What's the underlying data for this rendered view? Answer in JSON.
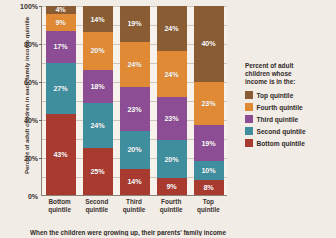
{
  "chart_data": {
    "type": "bar",
    "subtype": "stacked-percent-column",
    "title": "",
    "xlabel": "When the children were growing up, their parents' family income",
    "ylabel": "Percent of adult children in each family income quintile",
    "categories": [
      "Bottom quintile",
      "Second quintile",
      "Third quintile",
      "Fourth quintile",
      "Top quintile"
    ],
    "ylim": [
      0,
      100
    ],
    "yticks": [
      "0%",
      "20%",
      "40%",
      "60%",
      "80%",
      "100%"
    ],
    "ytick_values": [
      0,
      20,
      40,
      60,
      80,
      100
    ],
    "grid": true,
    "legend_position": "right",
    "legend_title": "Percent of adult children whose income is in the:",
    "stack_order_top_to_bottom": [
      "Top quintile",
      "Fourth quintile",
      "Third quintile",
      "Second quintile",
      "Bottom quintile"
    ],
    "series": [
      {
        "name": "Top quintile",
        "color": "#8a5c33",
        "values": [
          4,
          14,
          19,
          24,
          40
        ]
      },
      {
        "name": "Fourth quintile",
        "color": "#e08a35",
        "values": [
          9,
          20,
          24,
          24,
          23
        ]
      },
      {
        "name": "Third quintile",
        "color": "#8c4d94",
        "values": [
          17,
          18,
          23,
          23,
          19
        ]
      },
      {
        "name": "Second quintile",
        "color": "#3e8e9e",
        "values": [
          27,
          24,
          20,
          20,
          10
        ]
      },
      {
        "name": "Bottom quintile",
        "color": "#a93a30",
        "values": [
          43,
          25,
          14,
          9,
          8
        ]
      }
    ],
    "bars": [
      {
        "category": "Bottom quintile",
        "segments": [
          {
            "name": "Top quintile",
            "value": 4,
            "label": "4%",
            "color": "#8a5c33"
          },
          {
            "name": "Fourth quintile",
            "value": 9,
            "label": "9%",
            "color": "#e08a35"
          },
          {
            "name": "Third quintile",
            "value": 17,
            "label": "17%",
            "color": "#8c4d94"
          },
          {
            "name": "Second quintile",
            "value": 27,
            "label": "27%",
            "color": "#3e8e9e"
          },
          {
            "name": "Bottom quintile",
            "value": 43,
            "label": "43%",
            "color": "#a93a30"
          }
        ]
      },
      {
        "category": "Second quintile",
        "segments": [
          {
            "name": "Top quintile",
            "value": 14,
            "label": "14%",
            "color": "#8a5c33"
          },
          {
            "name": "Fourth quintile",
            "value": 20,
            "label": "20%",
            "color": "#e08a35"
          },
          {
            "name": "Third quintile",
            "value": 18,
            "label": "18%",
            "color": "#8c4d94"
          },
          {
            "name": "Second quintile",
            "value": 24,
            "label": "24%",
            "color": "#3e8e9e"
          },
          {
            "name": "Bottom quintile",
            "value": 25,
            "label": "25%",
            "color": "#a93a30"
          }
        ]
      },
      {
        "category": "Third quintile",
        "segments": [
          {
            "name": "Top quintile",
            "value": 19,
            "label": "19%",
            "color": "#8a5c33"
          },
          {
            "name": "Fourth quintile",
            "value": 24,
            "label": "24%",
            "color": "#e08a35"
          },
          {
            "name": "Third quintile",
            "value": 23,
            "label": "23%",
            "color": "#8c4d94"
          },
          {
            "name": "Second quintile",
            "value": 20,
            "label": "20%",
            "color": "#3e8e9e"
          },
          {
            "name": "Bottom quintile",
            "value": 14,
            "label": "14%",
            "color": "#a93a30"
          }
        ]
      },
      {
        "category": "Fourth quintile",
        "segments": [
          {
            "name": "Top quintile",
            "value": 24,
            "label": "24%",
            "color": "#8a5c33"
          },
          {
            "name": "Fourth quintile",
            "value": 24,
            "label": "24%",
            "color": "#e08a35"
          },
          {
            "name": "Third quintile",
            "value": 23,
            "label": "23%",
            "color": "#8c4d94"
          },
          {
            "name": "Second quintile",
            "value": 20,
            "label": "20%",
            "color": "#3e8e9e"
          },
          {
            "name": "Bottom quintile",
            "value": 9,
            "label": "9%",
            "color": "#a93a30"
          }
        ]
      },
      {
        "category": "Top quintile",
        "segments": [
          {
            "name": "Top quintile",
            "value": 40,
            "label": "40%",
            "color": "#8a5c33"
          },
          {
            "name": "Fourth quintile",
            "value": 23,
            "label": "23%",
            "color": "#e08a35"
          },
          {
            "name": "Third quintile",
            "value": 19,
            "label": "19%",
            "color": "#8c4d94"
          },
          {
            "name": "Second quintile",
            "value": 10,
            "label": "10%",
            "color": "#3e8e9e"
          },
          {
            "name": "Bottom quintile",
            "value": 8,
            "label": "8%",
            "color": "#a93a30"
          }
        ]
      }
    ]
  },
  "axes": {
    "y_title": "Percent of adult children in each family income quintile",
    "x_title": "When the children were growing up, their parents' family income",
    "y_ticks": [
      "100%",
      "80%",
      "60%",
      "40%",
      "20%",
      "0%"
    ],
    "x_categories": [
      {
        "line1": "Bottom",
        "line2": "quintile"
      },
      {
        "line1": "Second",
        "line2": "quintile"
      },
      {
        "line1": "Third",
        "line2": "quintile"
      },
      {
        "line1": "Fourth",
        "line2": "quintile"
      },
      {
        "line1": "Top",
        "line2": "quintile"
      }
    ]
  },
  "legend": {
    "title_line1": "Percent of adult",
    "title_line2": "children whose",
    "title_line3": "income is in the:",
    "items": [
      {
        "label": "Top quintile",
        "color": "#8a5c33"
      },
      {
        "label": "Fourth quintile",
        "color": "#e08a35"
      },
      {
        "label": "Third quintile",
        "color": "#8c4d94"
      },
      {
        "label": "Second quintile",
        "color": "#3e8e9e"
      },
      {
        "label": "Bottom quintile",
        "color": "#a93a30"
      }
    ]
  },
  "colors": {
    "background": "#f2ece6",
    "plot_background": "#f7f2ec",
    "axis": "#8a8076",
    "gridline": "#cfc6bb",
    "text": "#2f2a27"
  }
}
